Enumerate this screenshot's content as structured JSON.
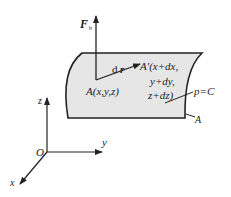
{
  "diagram": {
    "type": "fluid element on equipotential surface",
    "labels": {
      "force": "F",
      "force_sub": "b",
      "displacement_d": "d",
      "displacement_r": "r",
      "point_a": "A(x,y,z)",
      "point_a_prime_line1": "A′(x+dx,",
      "point_a_prime_line2": "y+dy,",
      "point_a_prime_line3": "z+dz)",
      "surface_eq": "p=C",
      "surface_name": "A",
      "axis_z": "z",
      "axis_y": "y",
      "axis_x": "x",
      "origin": "O"
    },
    "colors": {
      "surface_fill": "#e6e6e6",
      "stroke": "#222222",
      "background": "#ffffff"
    }
  }
}
